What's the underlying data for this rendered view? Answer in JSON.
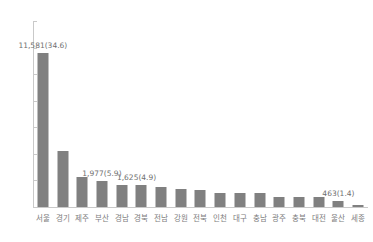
{
  "chart_data": {
    "type": "bar",
    "title": "",
    "xlabel": "",
    "ylabel": "",
    "ylim": [
      0,
      14000
    ],
    "ytick_step": 2000,
    "grid": false,
    "legend": "none",
    "orientation": "vertical",
    "bar_color": "#808080",
    "axis_color": "#c9c9c9",
    "text_color": "#7b7b7b",
    "yticks": [
      "0",
      "2,000",
      "4,000",
      "6,000",
      "8,000",
      "10,000",
      "12,000",
      "14,000"
    ],
    "ytick_values": [
      0,
      2000,
      4000,
      6000,
      8000,
      10000,
      12000,
      14000
    ],
    "categories": [
      "서울",
      "경기",
      "제주",
      "부산",
      "경남",
      "경북",
      "전남",
      "강원",
      "전북",
      "인천",
      "대구",
      "충남",
      "광주",
      "충북",
      "대전",
      "울산",
      "세종"
    ],
    "values": [
      11581,
      4250,
      2250,
      1977,
      1625,
      1620,
      1480,
      1350,
      1280,
      1050,
      1030,
      1050,
      750,
      730,
      760,
      463,
      120
    ],
    "data_labels": [
      "11,581(34.6)",
      "",
      "",
      "1,977(5.9)",
      "1,625(4.9)",
      "",
      "",
      "",
      "",
      "",
      "",
      "",
      "",
      "",
      "",
      "463(1.4)",
      ""
    ],
    "labeled_points": [
      {
        "category": "서울",
        "value": 11581,
        "share": 34.6,
        "label": "11,581(34.6)"
      },
      {
        "category": "부산",
        "value": 1977,
        "share": 5.9,
        "label": "1,977(5.9)"
      },
      {
        "category": "경남",
        "value": 1625,
        "share": 4.9,
        "label": "1,625(4.9)"
      },
      {
        "category": "울산",
        "value": 463,
        "share": 1.4,
        "label": "463(1.4)"
      }
    ]
  }
}
